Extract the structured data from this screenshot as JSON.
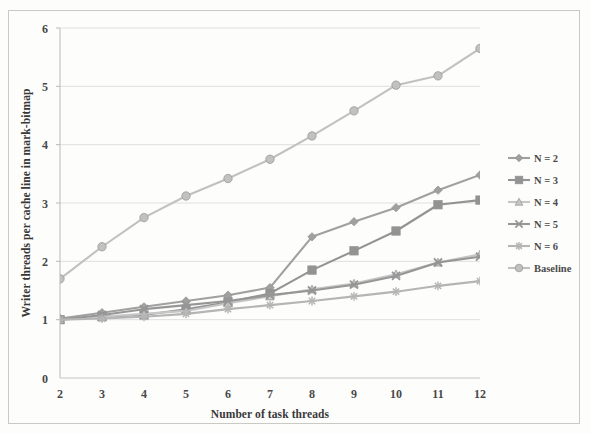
{
  "chart_data": {
    "type": "line",
    "title": "",
    "xlabel": "Number of task threads",
    "ylabel": "Writer threads per cache line in mark-bitmap",
    "x": [
      2,
      3,
      4,
      5,
      6,
      7,
      8,
      9,
      10,
      11,
      12
    ],
    "xticks": [
      "2",
      "3",
      "4",
      "5",
      "6",
      "7",
      "8",
      "9",
      "10",
      "11",
      "12"
    ],
    "yticks": [
      "0",
      "1",
      "2",
      "3",
      "4",
      "5",
      "6"
    ],
    "xlim": [
      2,
      12
    ],
    "ylim": [
      0,
      6
    ],
    "grid": "horizontal",
    "legend_position": "right",
    "series": [
      {
        "name": "N = 2",
        "marker": "diamond",
        "color": "#9a9a9a",
        "values": [
          1.02,
          1.12,
          1.22,
          1.32,
          1.42,
          1.55,
          2.42,
          2.68,
          2.92,
          3.22,
          3.48
        ]
      },
      {
        "name": "N = 3",
        "marker": "square",
        "color": "#8c8c8c",
        "values": [
          1.0,
          1.05,
          1.08,
          1.18,
          1.3,
          1.45,
          1.85,
          2.18,
          2.52,
          2.97,
          3.05
        ]
      },
      {
        "name": "N = 4",
        "marker": "triangle",
        "color": "#c2c2c2",
        "values": [
          1.0,
          1.05,
          1.1,
          1.15,
          1.28,
          1.4,
          1.52,
          1.62,
          1.78,
          1.98,
          2.12
        ]
      },
      {
        "name": "N = 5",
        "marker": "x",
        "color": "#8f8f8f",
        "values": [
          1.0,
          1.08,
          1.18,
          1.25,
          1.32,
          1.42,
          1.5,
          1.6,
          1.75,
          1.98,
          2.08
        ]
      },
      {
        "name": "N = 6",
        "marker": "asterisk",
        "color": "#b0b0b0",
        "values": [
          1.0,
          1.02,
          1.05,
          1.1,
          1.18,
          1.25,
          1.32,
          1.4,
          1.48,
          1.58,
          1.66
        ]
      },
      {
        "name": "Baseline",
        "marker": "circle",
        "color": "#bdbdbd",
        "values": [
          1.7,
          2.25,
          2.75,
          3.12,
          3.42,
          3.75,
          4.15,
          4.58,
          5.02,
          5.18,
          5.65
        ]
      }
    ]
  }
}
